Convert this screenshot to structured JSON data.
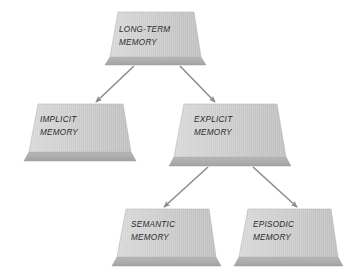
{
  "diagram": {
    "background_color": "#ffffff",
    "palette": {
      "slab_face_light": "#d6d6d6",
      "slab_face_dark": "#bdbdbd",
      "slab_edge": "#aeaeae",
      "slab_edge_shadow": "#9d9d9d",
      "slab_outline": "#b8b8b8",
      "text_color": "#2b2b2b",
      "arrow_color": "#8c8c8c"
    },
    "nodes": [
      {
        "id": "long-term-memory",
        "line1": "LONG-TERM",
        "line2": "MEMORY",
        "level": 0,
        "label_x": 119,
        "label_y": 24
      },
      {
        "id": "implicit-memory",
        "line1": "IMPLICIT",
        "line2": "MEMORY",
        "level": 1,
        "label_x": 40,
        "label_y": 114
      },
      {
        "id": "explicit-memory",
        "line1": "EXPLICIT",
        "line2": "MEMORY",
        "level": 1,
        "label_x": 194,
        "label_y": 114
      },
      {
        "id": "semantic-memory",
        "line1": "SEMANTIC",
        "line2": "MEMORY",
        "level": 2,
        "label_x": 131,
        "label_y": 219
      },
      {
        "id": "episodic-memory",
        "line1": "EPISODIC",
        "line2": "MEMORY",
        "level": 2,
        "label_x": 253,
        "label_y": 219
      }
    ],
    "edges": [
      {
        "id": "edge-longterm-implicit",
        "from": "long-term-memory",
        "to": "implicit-memory"
      },
      {
        "id": "edge-longterm-explicit",
        "from": "long-term-memory",
        "to": "explicit-memory"
      },
      {
        "id": "edge-explicit-semantic",
        "from": "explicit-memory",
        "to": "semantic-memory"
      },
      {
        "id": "edge-explicit-episodic",
        "from": "explicit-memory",
        "to": "episodic-memory"
      }
    ]
  }
}
